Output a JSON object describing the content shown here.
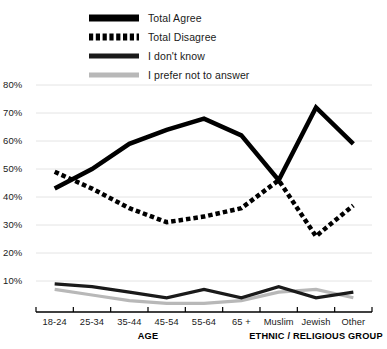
{
  "chart_data": {
    "type": "line",
    "title": "",
    "xlabel": "",
    "ylabel": "",
    "ylim": [
      0,
      80
    ],
    "yticks": [
      10,
      20,
      30,
      40,
      50,
      60,
      70,
      80
    ],
    "ytick_labels": [
      "10%",
      "20%",
      "30%",
      "40%",
      "50%",
      "60%",
      "70%",
      "80%"
    ],
    "grid": true,
    "legend_position": "top-left",
    "categories": [
      "18-24",
      "25-34",
      "35-44",
      "45-54",
      "55-64",
      "65 +",
      "Muslim",
      "Jewish",
      "Other"
    ],
    "group_labels": [
      {
        "text": "AGE",
        "categories": [
          "18-24",
          "25-34",
          "35-44",
          "45-54",
          "55-64",
          "65 +"
        ]
      },
      {
        "text": "ETHNIC / RELIGIOUS GROUP",
        "categories": [
          "Muslim",
          "Jewish",
          "Other"
        ]
      }
    ],
    "series": [
      {
        "name": "Total Agree",
        "style": "solid",
        "color": "#000000",
        "width": 4.5,
        "values": [
          43,
          50,
          59,
          64,
          68,
          62,
          46,
          72,
          59
        ]
      },
      {
        "name": "Total Disagree",
        "style": "dashed",
        "color": "#000000",
        "width": 4.5,
        "values": [
          49,
          43,
          36,
          31,
          33,
          36,
          46,
          26,
          37
        ]
      },
      {
        "name": "I don't know",
        "style": "solid",
        "color": "#1a1a1a",
        "width": 3.2,
        "values": [
          9,
          8,
          6,
          4,
          7,
          4,
          8,
          4,
          6
        ]
      },
      {
        "name": "I prefer not to answer",
        "style": "solid",
        "color": "#b8b8b8",
        "width": 3.2,
        "values": [
          7,
          5,
          3,
          2,
          2,
          3,
          6,
          7,
          4
        ]
      }
    ]
  },
  "legend": {
    "items": [
      {
        "label": "Total Agree",
        "swatch": "solid-thick-black"
      },
      {
        "label": "Total Disagree",
        "swatch": "dashed-thick-black"
      },
      {
        "label": "I don't know",
        "swatch": "solid-medium-black"
      },
      {
        "label": "I prefer not to answer",
        "swatch": "solid-medium-grey"
      }
    ]
  },
  "colors": {
    "agree": "#000000",
    "disagree": "#000000",
    "dont_know": "#1a1a1a",
    "prefer_not": "#b8b8b8",
    "grid": "#e4e4e4",
    "axis": "#000000"
  }
}
